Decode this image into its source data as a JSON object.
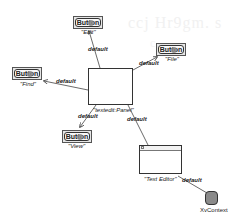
{
  "diagram": {
    "watermark": "ccj Hr9gm. s",
    "watermark2": "c",
    "colors": {
      "edge": "#444444",
      "node_border": "#333333",
      "button_bg": "#e6e6e6",
      "context_fill": "#8a8a8a",
      "background": "#ffffff"
    },
    "nodes": {
      "panel": {
        "label": "\"textedit:Panel\"",
        "type": "panel"
      },
      "edit": {
        "label": "\"Edit\"",
        "button_text": "Button",
        "type": "button"
      },
      "file": {
        "label": "\"File\"",
        "button_text": "Button",
        "type": "button"
      },
      "find": {
        "label": "\"Find\"",
        "button_text": "Button",
        "type": "button"
      },
      "view": {
        "label": "\"View\"",
        "button_text": "Button",
        "type": "button"
      },
      "text_editor": {
        "label": "\"Text Editor\"",
        "type": "window"
      },
      "context": {
        "label": "XvContext",
        "type": "context"
      }
    },
    "edges": [
      {
        "from": "panel",
        "to": "edit",
        "label": "default"
      },
      {
        "from": "panel",
        "to": "file",
        "label": "default"
      },
      {
        "from": "panel",
        "to": "find",
        "label": "default"
      },
      {
        "from": "panel",
        "to": "view",
        "label": "default"
      },
      {
        "from": "panel",
        "to": "text_editor",
        "label": "default"
      },
      {
        "from": "text_editor",
        "to": "context",
        "label": "default"
      }
    ]
  }
}
